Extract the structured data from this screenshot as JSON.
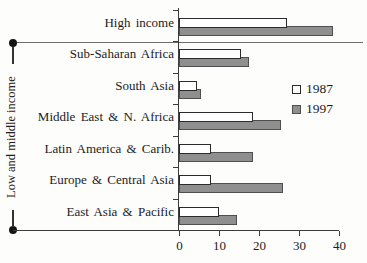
{
  "chart_data": {
    "type": "bar",
    "orientation": "horizontal",
    "title": "",
    "xlabel": "",
    "ylabel": "",
    "categories": [
      "High income",
      "Sub-Saharan Africa",
      "South Asia",
      "Middle East & N. Africa",
      "Latin America & Carib.",
      "Europe & Central Asia",
      "East Asia & Pacific"
    ],
    "series": [
      {
        "name": "1987",
        "color": "#ffffff",
        "values": [
          27,
          15.5,
          4.5,
          18.5,
          8,
          8,
          10
        ]
      },
      {
        "name": "1997",
        "color": "#8f8f8f",
        "values": [
          38.5,
          17.5,
          5.5,
          25.5,
          18.5,
          26,
          14.5
        ]
      }
    ],
    "xlim": [
      0,
      40
    ],
    "x_ticks": [
      0,
      10,
      20,
      30,
      40
    ],
    "grid": false,
    "legend_position": "middle-right",
    "group_bracket_label": "Low and middle income",
    "group_bracket_span": [
      "Sub-Saharan Africa",
      "East Asia & Pacific"
    ]
  },
  "legend": {
    "items": [
      {
        "label": "1987",
        "swatch": "white-square"
      },
      {
        "label": "1997",
        "swatch": "gray-square"
      }
    ]
  }
}
